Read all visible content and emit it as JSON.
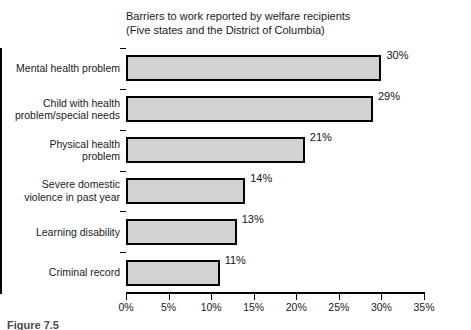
{
  "figure_caption": "Figure 7.5",
  "chart_data": {
    "type": "bar",
    "orientation": "horizontal",
    "title": "Barriers to work reported by welfare recipients",
    "subtitle": "(Five states and the District of Columbia)",
    "title_lines": [
      "Barriers to work reported by welfare recipients",
      "(Five states and the District of Columbia)"
    ],
    "categories": [
      "Mental health problem",
      "Child with health problem/special needs",
      "Physical health problem",
      "Severe domestic violence in past year",
      "Learning disability",
      "Criminal record"
    ],
    "category_lines": [
      [
        "Mental health problem"
      ],
      [
        "Child with health",
        "problem/special needs"
      ],
      [
        "Physical health",
        "problem"
      ],
      [
        "Severe domestic",
        "violence in past year"
      ],
      [
        "Learning disability"
      ],
      [
        "Criminal record"
      ]
    ],
    "values": [
      30,
      29,
      21,
      14,
      13,
      11
    ],
    "value_labels": [
      "30%",
      "29%",
      "21%",
      "14%",
      "13%",
      "11%"
    ],
    "xlabel": "",
    "ylabel": "",
    "xlim": [
      0,
      35
    ],
    "xticks": [
      0,
      5,
      10,
      15,
      20,
      25,
      30,
      35
    ],
    "xtick_labels": [
      "0%",
      "5%",
      "10%",
      "15%",
      "20%",
      "25%",
      "30%",
      "35%"
    ],
    "grid": false,
    "legend": false,
    "bar_fill_color": "#d2d2d2",
    "bar_edge_color": "#000000"
  }
}
